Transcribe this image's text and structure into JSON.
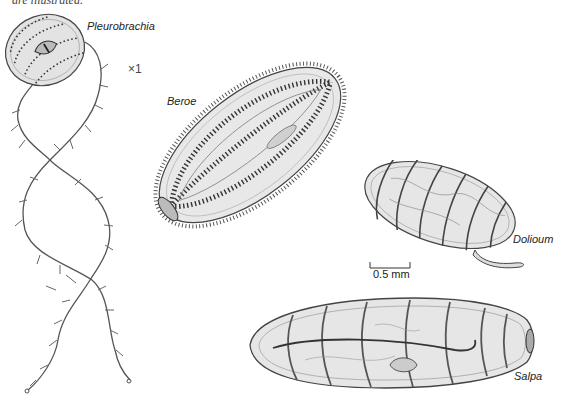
{
  "caption_fragment": "are illustrated.",
  "magnification": "×1",
  "scale_bar": {
    "label": "0.5 mm"
  },
  "specimens": [
    {
      "name": "Pleurobrachia"
    },
    {
      "name": "Beroe"
    },
    {
      "name": "Dolioum"
    },
    {
      "name": "Salpa"
    }
  ],
  "colors": {
    "ink": "#3a3a3a",
    "body_fill": "#e6e6e6",
    "body_shade": "#d2d2d2",
    "paper": "#ffffff"
  }
}
